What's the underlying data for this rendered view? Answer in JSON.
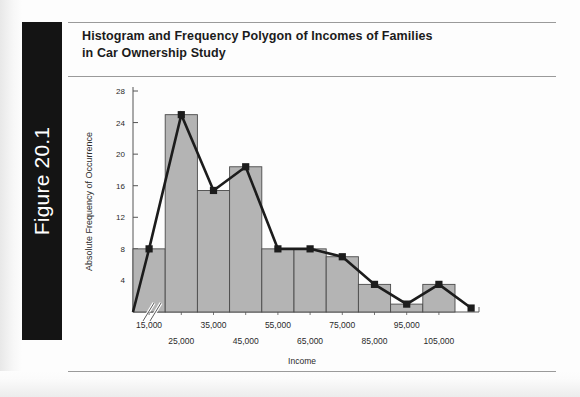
{
  "figure": {
    "tab_label": "Figure 20.1",
    "title_line1": "Histogram and Frequency Polygon of Incomes of Families",
    "title_line2": "in Car Ownership Study"
  },
  "chart_data": {
    "type": "bar",
    "title": "Histogram and Frequency Polygon of Incomes of Families in Car Ownership Study",
    "xlabel": "Income",
    "ylabel": "Absolute Frequency of Occurrence",
    "categories": [
      "15,000",
      "25,000",
      "35,000",
      "45,000",
      "55,000",
      "65,000",
      "75,000",
      "85,000",
      "95,000",
      "105,000"
    ],
    "values": [
      8,
      25,
      15.4,
      18.4,
      8,
      8,
      7,
      3.5,
      1,
      3.5
    ],
    "ylim": [
      0,
      28
    ],
    "yticks": [
      4,
      8,
      12,
      16,
      20,
      24,
      28
    ],
    "ytick_labels": [
      "4",
      "8",
      "12",
      "16",
      "20",
      "24",
      "28"
    ],
    "grid": false,
    "legend": "none",
    "axis_break": true,
    "series": [
      {
        "name": "Histogram",
        "kind": "bar",
        "values": [
          8,
          25,
          15.4,
          18.4,
          8,
          8,
          7,
          3.5,
          1,
          3.5
        ],
        "fill_color": "#b4b4b4",
        "edge_color": "#4a4a4a"
      },
      {
        "name": "Frequency Polygon",
        "kind": "line",
        "values": [
          8,
          25,
          15.4,
          18.4,
          8,
          8,
          7,
          3.5,
          1,
          3.5
        ],
        "anchor_start": 0,
        "anchor_end": 0.5,
        "line_color": "#1c1c1c",
        "marker": "square"
      }
    ]
  },
  "colors": {
    "bar_fill": "#b4b4b4",
    "bar_edge": "#4a4a4a",
    "polygon_line": "#1c1c1c",
    "tab_background": "#141414",
    "tab_text": "#ffffff",
    "rule": "#9a9a9a"
  }
}
